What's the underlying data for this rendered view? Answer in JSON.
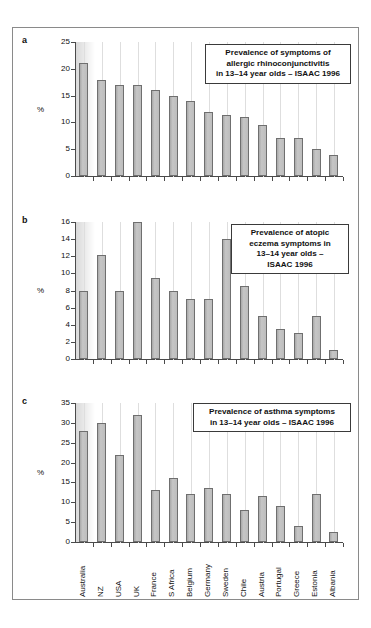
{
  "figure": {
    "background": "#ffffff",
    "frame_color": "#8a8a8a",
    "bar_fill": "#bdbdbd",
    "bar_stroke": "#6f6f6f",
    "grid_color": "#dedede"
  },
  "categories": [
    "Australia",
    "NZ",
    "USA",
    "UK",
    "France",
    "S Africa",
    "Belgium",
    "Germany",
    "Sweden",
    "Chile",
    "Austria",
    "Portugal",
    "Greece",
    "Estonia",
    "Albania"
  ],
  "panels": [
    {
      "letter": "a",
      "callout": "Prevalence of symptoms of allergic rhinoconjunctivitis in 13–14 year olds – ISAAC 1996",
      "callout_lines": [
        "Prevalence of symptoms of",
        "allergic rhinoconjunctivitis",
        "in 13–14 year olds – ISAAC 1996"
      ],
      "ylabel": "%",
      "yticks": [
        0,
        5,
        10,
        15,
        20,
        25
      ],
      "ymax": 25,
      "values": [
        21,
        18,
        17,
        17,
        16,
        15,
        14,
        12,
        11.4,
        11,
        9.5,
        7,
        7,
        5,
        4
      ]
    },
    {
      "letter": "b",
      "callout": "Prevalence of atopic eczema symptoms in 13–14 year olds – ISAAC 1996",
      "callout_lines": [
        "Prevalence of atopic",
        "eczema symptoms in",
        "13–14 year olds –",
        "ISAAC 1996"
      ],
      "ylabel": "%",
      "yticks": [
        0,
        2,
        4,
        6,
        8,
        10,
        12,
        14,
        16
      ],
      "ymax": 16,
      "values": [
        8,
        12.1,
        8,
        16,
        9.5,
        8,
        7,
        7,
        14,
        8.5,
        5,
        3.5,
        3,
        5,
        1
      ]
    },
    {
      "letter": "c",
      "callout": "Prevalence of asthma symptoms in 13–14 year olds – ISAAC 1996",
      "callout_lines": [
        "Prevalence of asthma symptoms",
        "in 13–14 year olds – ISAAC 1996"
      ],
      "ylabel": "%",
      "yticks": [
        0,
        5,
        10,
        15,
        20,
        25,
        30,
        35
      ],
      "ymax": 35,
      "values": [
        28,
        30,
        22,
        32,
        13,
        16,
        12,
        13.5,
        12,
        8,
        11.5,
        9,
        4,
        12,
        2.5
      ]
    }
  ],
  "chart_data": [
    {
      "type": "bar",
      "title": "Prevalence of symptoms of allergic rhinoconjunctivitis in 13–14 year olds – ISAAC 1996",
      "panel": "a",
      "categories": [
        "Australia",
        "NZ",
        "USA",
        "UK",
        "France",
        "S Africa",
        "Belgium",
        "Germany",
        "Sweden",
        "Chile",
        "Austria",
        "Portugal",
        "Greece",
        "Estonia",
        "Albania"
      ],
      "values": [
        21,
        18,
        17,
        17,
        16,
        15,
        14,
        12,
        11.4,
        11,
        9.5,
        7,
        7,
        5,
        4
      ],
      "xlabel": "",
      "ylabel": "%",
      "ylim": [
        0,
        25
      ],
      "yticks": [
        0,
        5,
        10,
        15,
        20,
        25
      ],
      "grid": true,
      "legend": "none"
    },
    {
      "type": "bar",
      "title": "Prevalence of atopic eczema symptoms in 13–14 year olds – ISAAC 1996",
      "panel": "b",
      "categories": [
        "Australia",
        "NZ",
        "USA",
        "UK",
        "France",
        "S Africa",
        "Belgium",
        "Germany",
        "Sweden",
        "Chile",
        "Austria",
        "Portugal",
        "Greece",
        "Estonia",
        "Albania"
      ],
      "values": [
        8,
        12.1,
        8,
        16,
        9.5,
        8,
        7,
        7,
        14,
        8.5,
        5,
        3.5,
        3,
        5,
        1
      ],
      "xlabel": "",
      "ylabel": "%",
      "ylim": [
        0,
        16
      ],
      "yticks": [
        0,
        2,
        4,
        6,
        8,
        10,
        12,
        14,
        16
      ],
      "grid": true,
      "legend": "none"
    },
    {
      "type": "bar",
      "title": "Prevalence of asthma symptoms in 13–14 year olds – ISAAC 1996",
      "panel": "c",
      "categories": [
        "Australia",
        "NZ",
        "USA",
        "UK",
        "France",
        "S Africa",
        "Belgium",
        "Germany",
        "Sweden",
        "Chile",
        "Austria",
        "Portugal",
        "Greece",
        "Estonia",
        "Albania"
      ],
      "values": [
        28,
        30,
        22,
        32,
        13,
        16,
        12,
        13.5,
        12,
        8,
        11.5,
        9,
        4,
        12,
        2.5
      ],
      "xlabel": "",
      "ylabel": "%",
      "ylim": [
        0,
        35
      ],
      "yticks": [
        0,
        5,
        10,
        15,
        20,
        25,
        30,
        35
      ],
      "grid": true,
      "legend": "none"
    }
  ]
}
